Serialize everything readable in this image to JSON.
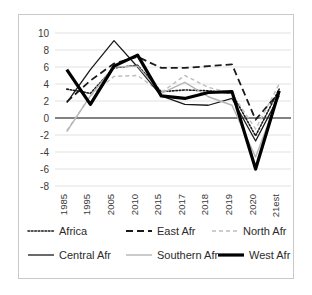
{
  "chart_data": {
    "type": "line",
    "title": "",
    "xlabel": "",
    "ylabel": "",
    "ylim": [
      -8,
      10
    ],
    "yticks": [
      10,
      8,
      6,
      4,
      2,
      0,
      -2,
      -4,
      -6,
      -8
    ],
    "grid": true,
    "legend_position": "bottom",
    "categories": [
      "1985",
      "1995",
      "2005",
      "2010",
      "2015",
      "2017",
      "2018",
      "2019",
      "2020",
      "2021est"
    ],
    "series": [
      {
        "name": "Africa",
        "style": "dotted",
        "color": "#1a1a1a",
        "width": 1.6,
        "values": [
          3.4,
          2.9,
          5.9,
          6.2,
          3.1,
          3.3,
          3.2,
          2.9,
          -2.1,
          3.4
        ]
      },
      {
        "name": "East Afr",
        "style": "dashed",
        "color": "#1a1a1a",
        "width": 1.8,
        "values": [
          1.9,
          4.4,
          6.4,
          7.2,
          5.9,
          5.9,
          6.1,
          6.3,
          -0.2,
          3.0
        ]
      },
      {
        "name": "North Afr",
        "style": "dashed",
        "color": "#bdbdbd",
        "width": 1.4,
        "values": [
          -1.5,
          2.6,
          4.9,
          5.0,
          3.0,
          5.0,
          3.6,
          2.9,
          -1.3,
          4.0
        ]
      },
      {
        "name": "Central Afr",
        "style": "solid",
        "color": "#1a1a1a",
        "width": 1.3,
        "values": [
          1.8,
          5.7,
          9.1,
          6.0,
          2.6,
          1.6,
          1.5,
          2.3,
          -2.7,
          2.6
        ]
      },
      {
        "name": "Southern Afr",
        "style": "solid",
        "color": "#b5b5b5",
        "width": 1.4,
        "values": [
          -1.6,
          2.6,
          6.0,
          6.1,
          2.9,
          4.2,
          2.5,
          1.5,
          -4.6,
          2.8
        ]
      },
      {
        "name": "West Afr",
        "style": "solid",
        "color": "#000000",
        "width": 3.2,
        "values": [
          5.7,
          1.6,
          6.1,
          7.4,
          2.6,
          2.3,
          3.0,
          3.1,
          -6.0,
          3.2
        ]
      }
    ]
  },
  "legend": {
    "rows": [
      [
        "Africa",
        "East Afr",
        "North Afr"
      ],
      [
        "Central Afr",
        "Southern Afr",
        "West Afr"
      ]
    ]
  }
}
